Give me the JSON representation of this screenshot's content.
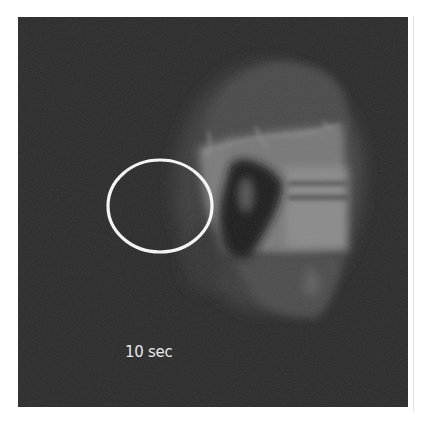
{
  "figure": {
    "caption": "10 sec",
    "background_color": "#2a2a2a",
    "highlight": {
      "shape": "ellipse",
      "color": "#f4f4f4",
      "cx": 160,
      "cy": 206,
      "rx": 53,
      "ry": 47
    }
  }
}
